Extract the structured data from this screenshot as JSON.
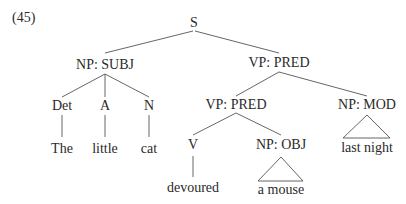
{
  "example_number": "(45)",
  "tree": {
    "root": "S",
    "subject": {
      "label": "NP: SUBJ",
      "children": [
        {
          "category": "Det",
          "word": "The"
        },
        {
          "category": "A",
          "word": "little"
        },
        {
          "category": "N",
          "word": "cat"
        }
      ]
    },
    "predicate": {
      "label": "VP: PRED",
      "inner_vp": {
        "label": "VP: PRED",
        "verb": {
          "category": "V",
          "word": "devoured"
        },
        "object": {
          "label": "NP: OBJ",
          "text": "a mouse"
        }
      },
      "modifier": {
        "label": "NP: MOD",
        "text": "last night"
      }
    }
  },
  "style": {
    "text_color": "#2a2a2a",
    "line_color": "#555555",
    "background": "#ffffff"
  }
}
